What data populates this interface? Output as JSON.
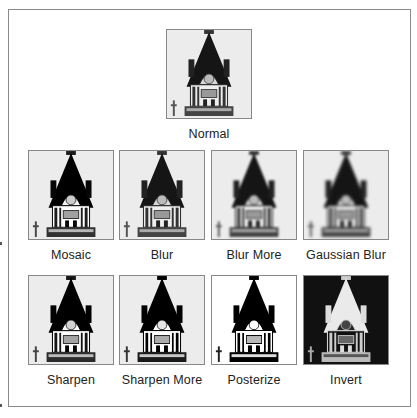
{
  "figure": {
    "normal": {
      "label": "Normal",
      "icon": "tower-image-icon"
    },
    "row1": [
      {
        "label": "Mosaic",
        "effect": "mosaic"
      },
      {
        "label": "Blur",
        "effect": "blur"
      },
      {
        "label": "Blur More",
        "effect": "blur-more"
      },
      {
        "label": "Gaussian Blur",
        "effect": "gaussian-blur"
      }
    ],
    "row2": [
      {
        "label": "Sharpen",
        "effect": "sharpen"
      },
      {
        "label": "Sharpen More",
        "effect": "sharpen-more"
      },
      {
        "label": "Posterize",
        "effect": "posterize"
      },
      {
        "label": "Invert",
        "effect": "invert"
      }
    ]
  },
  "colors": {
    "frame_border": "#8a8a8a",
    "text": "#222222",
    "image_bg": "#ececec"
  }
}
